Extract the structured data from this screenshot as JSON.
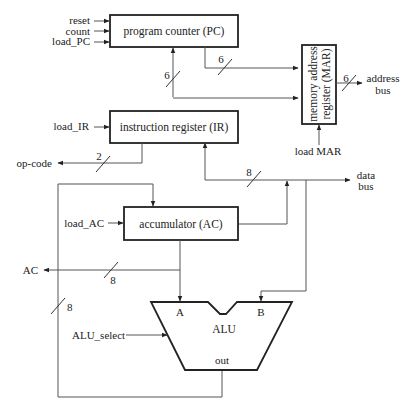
{
  "blocks": {
    "pc": "program counter (PC)",
    "ir": "instruction register (IR)",
    "ac": "accumulator (AC)",
    "mar_line1": "memory address",
    "mar_line2": "register (MAR)",
    "alu": "ALU"
  },
  "inputs": {
    "reset": "reset",
    "count": "count",
    "load_pc": "load_PC",
    "load_ir": "load_IR",
    "load_ac": "load_AC",
    "load_mar": "load MAR",
    "alu_select": "ALU_select"
  },
  "outputs": {
    "op_code": "op-code",
    "ac_out": "AC",
    "address_bus_line1": "address",
    "address_bus_line2": "bus",
    "data_bus_line1": "data",
    "data_bus_line2": "bus"
  },
  "alu_ports": {
    "a": "A",
    "b": "B",
    "out": "out"
  },
  "bus_widths": {
    "pc_to_mar": "6",
    "ir_to_pc": "6",
    "address_bus": "6",
    "op_code": "2",
    "data_bus": "8",
    "ac_out": "8",
    "feedback": "8"
  }
}
